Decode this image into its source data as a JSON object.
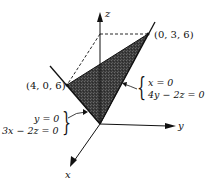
{
  "diagram": {
    "axes": {
      "x_label": "x",
      "y_label": "y",
      "z_label": "z"
    },
    "points": {
      "p1": "(0, 3, 6)",
      "p2": "(4, 0, 6)"
    },
    "annotations": {
      "right_system": {
        "line1": "x = 0",
        "line2": "4y − 2z = 0"
      },
      "left_system": {
        "line1": "y = 0",
        "line2": "3x − 2z = 0"
      }
    },
    "colors": {
      "ink": "#111111",
      "shaded_region": "#3a3a3a",
      "background": "#ffffff"
    }
  }
}
